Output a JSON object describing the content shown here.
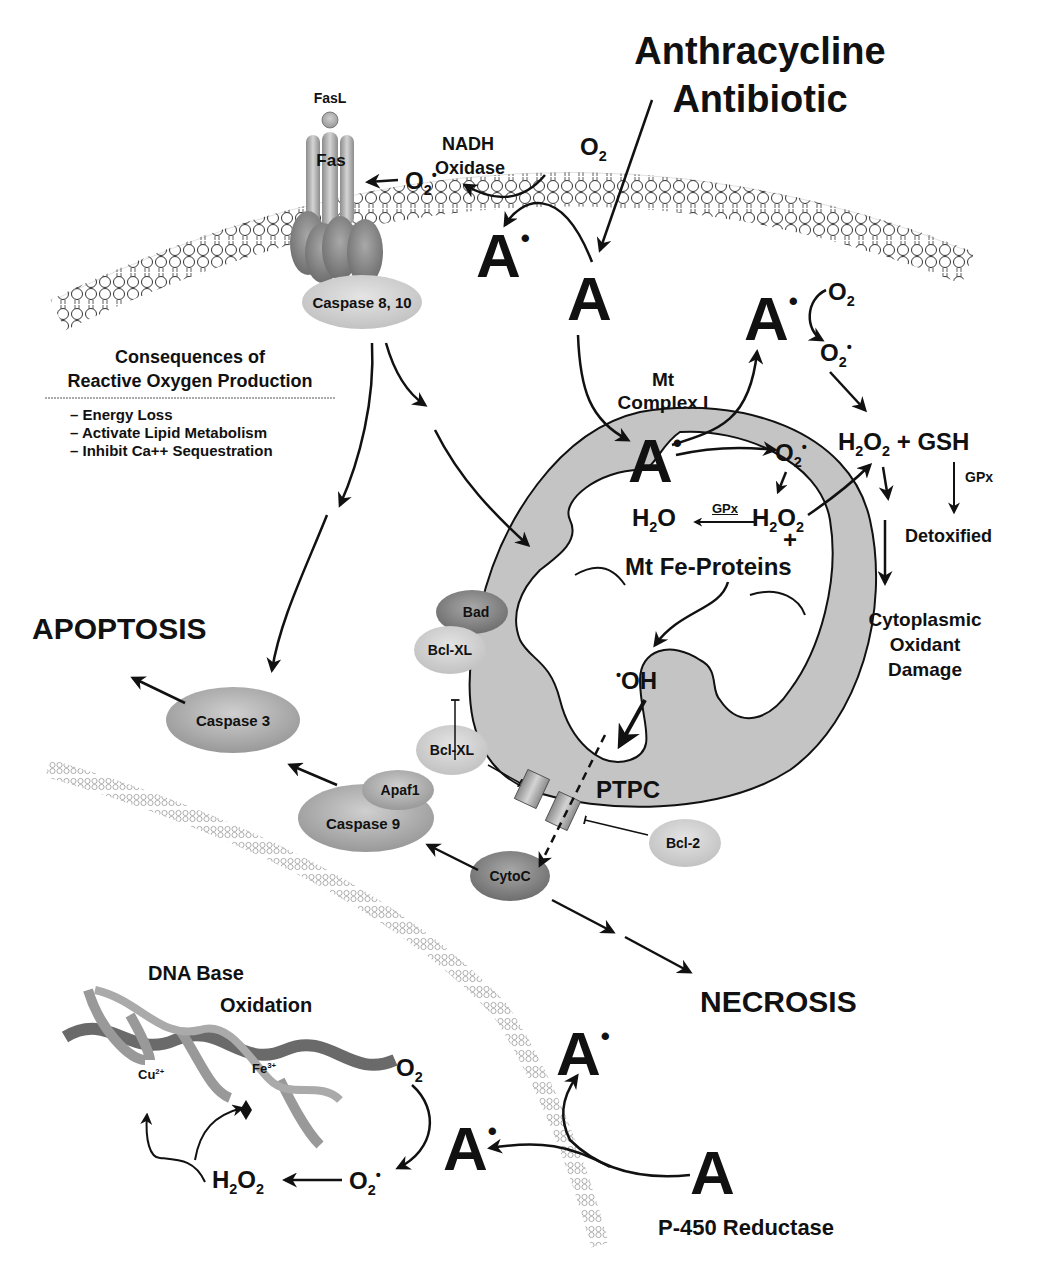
{
  "title": {
    "line1": "Anthracycline",
    "line2": "Antibiotic"
  },
  "membrane": {
    "fas_ligand": "FasL",
    "fas_receptor": "Fas",
    "caspase_8_10": "Caspase 8, 10",
    "nadh_oxidase_line1": "NADH",
    "nadh_oxidase_line2": "Oxidase",
    "o2_top": "O",
    "o2_sub": "2",
    "superoxide_membrane": "O",
    "superoxide_sub": "2",
    "superoxide_sup": "•",
    "a_radical_top": "A",
    "a_top": "A"
  },
  "consequences": {
    "heading_line1": "Consequences of",
    "heading_line2": "Reactive Oxygen Production",
    "items": [
      "– Energy Loss",
      "– Activate Lipid Metabolism",
      "– Inhibit Ca++ Sequestration"
    ]
  },
  "mitochondria": {
    "complex_line1": "Mt",
    "complex_line2": "Complex I",
    "a_radical": "A",
    "superoxide": "O",
    "h2o": "H",
    "gpx_inner": "GPx",
    "h2o2_inner": "H",
    "plus": "+",
    "fe_proteins": "Mt Fe-Proteins",
    "hydroxyl": "OH",
    "ptpc": "PTPC"
  },
  "cytoplasm_right": {
    "a_radical": "A",
    "o2": "O",
    "superoxide": "O",
    "h2o2_gsh": "+ GSH",
    "gpx": "GPx",
    "detoxified": "Detoxified",
    "damage_line1": "Cytoplasmic",
    "damage_line2": "Oxidant",
    "damage_line3": "Damage"
  },
  "proteins": {
    "bad": "Bad",
    "bclxl_1": "Bcl-XL",
    "bclxl_2": "Bcl-XL",
    "bcl2": "Bcl-2",
    "caspase3": "Caspase 3",
    "apaf1": "Apaf1",
    "caspase9": "Caspase 9",
    "cytoc": "CytoC"
  },
  "outcomes": {
    "apoptosis": "APOPTOSIS",
    "necrosis": "NECROSIS"
  },
  "nucleus": {
    "dna_line1": "DNA Base",
    "dna_line2": "Oxidation",
    "cu": "Cu",
    "cu_charge": "2+",
    "fe": "Fe",
    "fe_charge": "3+",
    "o2": "O",
    "superoxide": "O",
    "h2o2": "H",
    "a_radical_left": "A",
    "a_radical_up": "A",
    "a_bottom": "A",
    "p450": "P-450 Reductase"
  },
  "colors": {
    "membrane_stroke": "#333333",
    "mito_fill": "#c4c4c4",
    "protein_dark": "#8a8a8a",
    "protein_mid": "#a9a9a9",
    "protein_light": "#cfcfcf",
    "text": "#111111"
  }
}
